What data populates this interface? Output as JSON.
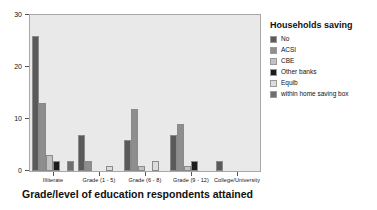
{
  "chart_data": {
    "type": "bar",
    "title": "",
    "xlabel": "Grade/level of education respondents attained",
    "ylabel": "",
    "ylim": [
      0,
      30
    ],
    "yticks": [
      0,
      10,
      20,
      30
    ],
    "grid": false,
    "legend_position": "right",
    "legend_title": "Households saving",
    "categories": [
      "Illiterate",
      "Grade (1 - 5)",
      "Grade (6 - 8)",
      "Grade (9 - 12)",
      "College/University"
    ],
    "series": [
      {
        "name": "No",
        "color": "#5a5a5a",
        "values": [
          26,
          7,
          6,
          7,
          2
        ]
      },
      {
        "name": "ACSI",
        "color": "#8e8e8e",
        "values": [
          13,
          2,
          12,
          9,
          0
        ]
      },
      {
        "name": "CBE",
        "color": "#c2c2c2",
        "values": [
          3,
          0,
          1,
          1,
          0
        ]
      },
      {
        "name": "Other banks",
        "color": "#1c1c1c",
        "values": [
          2,
          0,
          0,
          2,
          0
        ]
      },
      {
        "name": "Equib",
        "color": "#dcdcdc",
        "values": [
          0,
          1,
          2,
          0,
          0
        ]
      },
      {
        "name": "within home saving box",
        "color": "#6e6e6e",
        "values": [
          2,
          0,
          0,
          0,
          0
        ]
      }
    ]
  },
  "axis": {
    "ytick_labels": [
      "0",
      "10",
      "20",
      "30"
    ],
    "xtick_labels": [
      "Illiterate",
      "Grade (1 - 5)",
      "Grade (6 - 8)",
      "Grade (9 - 12)",
      "College/University"
    ],
    "xtitle": "Grade/level of education respondents attained"
  },
  "legend": {
    "title": "Households saving",
    "items": [
      {
        "label": "No"
      },
      {
        "label": "ACSI"
      },
      {
        "label": "CBE"
      },
      {
        "label": "Other banks"
      },
      {
        "label": "Equib"
      },
      {
        "label": "within home saving box"
      }
    ]
  }
}
